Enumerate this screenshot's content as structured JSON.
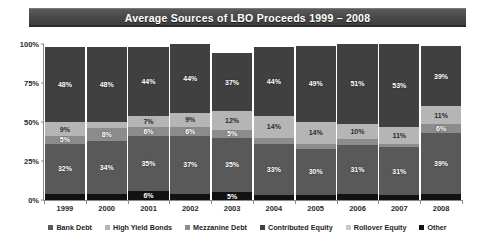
{
  "header": {
    "title": "Average Sources of LBO Proceeds 1999 – 2008"
  },
  "legend": {
    "items": [
      {
        "label": "Bank Debt",
        "color": "#595959"
      },
      {
        "label": "High Yield Bonds",
        "color": "#b5b5b5"
      },
      {
        "label": "Mezzanine Debt",
        "color": "#8c8c8c"
      },
      {
        "label": "Contributed Equity",
        "color": "#404040"
      },
      {
        "label": "Rollover Equity",
        "color": "#c9c9c9"
      },
      {
        "label": "Other",
        "color": "#121212"
      }
    ]
  },
  "axis": {
    "yticks": [
      "100%",
      "75%",
      "50%",
      "25%",
      "0%"
    ],
    "ylabel": "",
    "xlabel": ""
  },
  "chart_data": {
    "type": "bar",
    "subtype": "stacked-column-100",
    "title": "Average Sources of LBO Proceeds 1999 – 2008",
    "xlabel": "",
    "ylabel": "",
    "ylim": [
      0,
      100
    ],
    "ytick_values": [
      0,
      25,
      50,
      75,
      100
    ],
    "grid": false,
    "legend_position": "bottom",
    "categories": [
      "1999",
      "2000",
      "2001",
      "2002",
      "2003",
      "2004",
      "2005",
      "2006",
      "2007",
      "2008"
    ],
    "stack_order_bottom_to_top": [
      "Other",
      "Bank Debt",
      "Mezzanine Debt",
      "High Yield Bonds",
      "Contributed Equity"
    ],
    "series": [
      {
        "name": "Other",
        "color": "#121212",
        "values": [
          4,
          4,
          6,
          4,
          5,
          3,
          3,
          4,
          3,
          4
        ]
      },
      {
        "name": "Bank Debt",
        "color": "#595959",
        "values": [
          32,
          34,
          35,
          37,
          35,
          33,
          30,
          31,
          31,
          39
        ]
      },
      {
        "name": "Mezzanine Debt",
        "color": "#8c8c8c",
        "values": [
          5,
          8,
          6,
          6,
          5,
          4,
          3,
          4,
          2,
          6
        ]
      },
      {
        "name": "High Yield Bonds",
        "color": "#b5b5b5",
        "values": [
          9,
          4,
          7,
          9,
          12,
          14,
          14,
          10,
          11,
          11
        ]
      },
      {
        "name": "Contributed Equity",
        "color": "#404040",
        "values": [
          48,
          48,
          44,
          44,
          37,
          44,
          49,
          51,
          53,
          39
        ]
      },
      {
        "name": "Rollover Equity",
        "color": "#c9c9c9",
        "values": [
          0,
          0,
          0,
          0,
          0,
          0,
          0,
          0,
          0,
          0
        ]
      }
    ],
    "bars": [
      {
        "category": "1999",
        "segments": [
          {
            "name": "Contributed Equity",
            "value": 48,
            "label": "48%",
            "color": "#404040"
          },
          {
            "name": "High Yield Bonds",
            "value": 9,
            "label": "9%",
            "color": "#b5b5b5"
          },
          {
            "name": "Mezzanine Debt",
            "value": 5,
            "label": "5%",
            "color": "#8c8c8c"
          },
          {
            "name": "Bank Debt",
            "value": 32,
            "label": "32%",
            "color": "#595959"
          },
          {
            "name": "Other",
            "value": 4,
            "label": "4%",
            "color": "#121212"
          }
        ]
      },
      {
        "category": "2000",
        "segments": [
          {
            "name": "Contributed Equity",
            "value": 48,
            "label": "48%",
            "color": "#404040"
          },
          {
            "name": "High Yield Bonds",
            "value": 4,
            "label": "4%",
            "color": "#b5b5b5"
          },
          {
            "name": "Mezzanine Debt",
            "value": 8,
            "label": "8%",
            "color": "#8c8c8c"
          },
          {
            "name": "Bank Debt",
            "value": 34,
            "label": "34%",
            "color": "#595959"
          },
          {
            "name": "Other",
            "value": 4,
            "label": "4%",
            "color": "#121212"
          }
        ]
      },
      {
        "category": "2001",
        "segments": [
          {
            "name": "Contributed Equity",
            "value": 44,
            "label": "44%",
            "color": "#404040"
          },
          {
            "name": "High Yield Bonds",
            "value": 7,
            "label": "7%",
            "color": "#b5b5b5"
          },
          {
            "name": "Mezzanine Debt",
            "value": 6,
            "label": "6%",
            "color": "#8c8c8c"
          },
          {
            "name": "Bank Debt",
            "value": 35,
            "label": "35%",
            "color": "#595959"
          },
          {
            "name": "Other",
            "value": 6,
            "label": "6%",
            "color": "#121212"
          }
        ]
      },
      {
        "category": "2002",
        "segments": [
          {
            "name": "Contributed Equity",
            "value": 44,
            "label": "44%",
            "color": "#404040"
          },
          {
            "name": "High Yield Bonds",
            "value": 9,
            "label": "9%",
            "color": "#b5b5b5"
          },
          {
            "name": "Mezzanine Debt",
            "value": 6,
            "label": "6%",
            "color": "#8c8c8c"
          },
          {
            "name": "Bank Debt",
            "value": 37,
            "label": "37%",
            "color": "#595959"
          },
          {
            "name": "Other",
            "value": 4,
            "label": "4%",
            "color": "#121212"
          }
        ]
      },
      {
        "category": "2003",
        "segments": [
          {
            "name": "Contributed Equity",
            "value": 37,
            "label": "37%",
            "color": "#404040"
          },
          {
            "name": "High Yield Bonds",
            "value": 12,
            "label": "12%",
            "color": "#b5b5b5"
          },
          {
            "name": "Mezzanine Debt",
            "value": 5,
            "label": "5%",
            "color": "#8c8c8c"
          },
          {
            "name": "Bank Debt",
            "value": 35,
            "label": "35%",
            "color": "#595959"
          },
          {
            "name": "Other",
            "value": 5,
            "label": "5%",
            "color": "#121212"
          }
        ]
      },
      {
        "category": "2004",
        "segments": [
          {
            "name": "Contributed Equity",
            "value": 44,
            "label": "44%",
            "color": "#404040"
          },
          {
            "name": "High Yield Bonds",
            "value": 14,
            "label": "14%",
            "color": "#b5b5b5"
          },
          {
            "name": "Mezzanine Debt",
            "value": 4,
            "label": "4%",
            "color": "#8c8c8c"
          },
          {
            "name": "Bank Debt",
            "value": 33,
            "label": "33%",
            "color": "#595959"
          },
          {
            "name": "Other",
            "value": 3,
            "label": "",
            "color": "#121212"
          }
        ]
      },
      {
        "category": "2005",
        "segments": [
          {
            "name": "Contributed Equity",
            "value": 49,
            "label": "49%",
            "color": "#404040"
          },
          {
            "name": "High Yield Bonds",
            "value": 14,
            "label": "14%",
            "color": "#b5b5b5"
          },
          {
            "name": "Mezzanine Debt",
            "value": 3,
            "label": "3%",
            "color": "#8c8c8c"
          },
          {
            "name": "Bank Debt",
            "value": 30,
            "label": "30%",
            "color": "#595959"
          },
          {
            "name": "Other",
            "value": 3,
            "label": "",
            "color": "#121212"
          }
        ]
      },
      {
        "category": "2006",
        "segments": [
          {
            "name": "Contributed Equity",
            "value": 51,
            "label": "51%",
            "color": "#404040"
          },
          {
            "name": "High Yield Bonds",
            "value": 10,
            "label": "10%",
            "color": "#b5b5b5"
          },
          {
            "name": "Mezzanine Debt",
            "value": 4,
            "label": "4%",
            "color": "#8c8c8c"
          },
          {
            "name": "Bank Debt",
            "value": 31,
            "label": "31%",
            "color": "#595959"
          },
          {
            "name": "Other",
            "value": 4,
            "label": "",
            "color": "#121212"
          }
        ]
      },
      {
        "category": "2007",
        "segments": [
          {
            "name": "Contributed Equity",
            "value": 53,
            "label": "53%",
            "color": "#404040"
          },
          {
            "name": "High Yield Bonds",
            "value": 11,
            "label": "11%",
            "color": "#b5b5b5"
          },
          {
            "name": "Mezzanine Debt",
            "value": 2,
            "label": "2%",
            "color": "#8c8c8c"
          },
          {
            "name": "Bank Debt",
            "value": 31,
            "label": "31%",
            "color": "#595959"
          },
          {
            "name": "Other",
            "value": 3,
            "label": "",
            "color": "#121212"
          }
        ]
      },
      {
        "category": "2008",
        "segments": [
          {
            "name": "Contributed Equity",
            "value": 39,
            "label": "39%",
            "color": "#404040"
          },
          {
            "name": "High Yield Bonds",
            "value": 11,
            "label": "11%",
            "color": "#b5b5b5"
          },
          {
            "name": "Mezzanine Debt",
            "value": 6,
            "label": "6%",
            "color": "#8c8c8c"
          },
          {
            "name": "Bank Debt",
            "value": 39,
            "label": "39%",
            "color": "#595959"
          },
          {
            "name": "Other",
            "value": 4,
            "label": "4%",
            "color": "#121212"
          }
        ]
      }
    ]
  }
}
